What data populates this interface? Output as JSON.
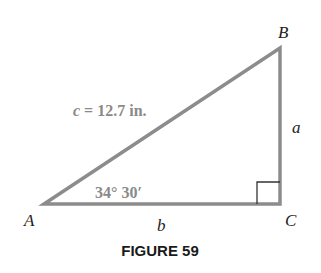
{
  "figure": {
    "caption": "FIGURE 59",
    "vertices": {
      "A": "A",
      "B": "B",
      "C": "C"
    },
    "sides": {
      "hypotenuse_label": "c = 12.7 in.",
      "hyp_var": "c",
      "hyp_rest": " = 12.7 in.",
      "a": "a",
      "b": "b"
    },
    "angle_A": "34° 30′",
    "colors": {
      "triangle_stroke": "#8c8c8c",
      "label_gray": "#8a8a8a",
      "text": "#222222"
    }
  }
}
